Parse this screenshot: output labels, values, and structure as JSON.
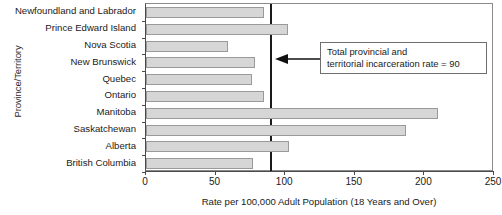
{
  "chart_data": {
    "type": "bar",
    "orientation": "horizontal",
    "title": "",
    "xlabel": "Rate per 100,000 Adult Population (18 Years and Over)",
    "ylabel": "Province/Territory",
    "xlim": [
      0,
      250
    ],
    "xticks": [
      0,
      50,
      100,
      150,
      200,
      250
    ],
    "xtick_labels": [
      "0",
      "50",
      "100",
      "150",
      "200",
      "250"
    ],
    "grid": false,
    "legend": null,
    "categories": [
      "Newfoundland and Labrador",
      "Prince Edward Island",
      "Nova Scotia",
      "New Brunswick",
      "Quebec",
      "Ontario",
      "Manitoba",
      "Saskatchewan",
      "Alberta",
      "British Columbia"
    ],
    "values": [
      85,
      102,
      59,
      78,
      76,
      85,
      210,
      187,
      103,
      77
    ],
    "bar_color": "#d6d6d6",
    "bar_edge_color": "#9a9a9a",
    "reference_line": {
      "value": 90,
      "color": "#1a1a1a",
      "annotation_lines": [
        "Total provincial and",
        "territorial incarceration rate = 90"
      ]
    }
  },
  "annotation": {
    "line1": "Total provincial and",
    "line2": "territorial incarceration rate = 90"
  },
  "axes": {
    "xlabel": "Rate per 100,000 Adult Population (18 Years and Over)",
    "ylabel": "Province/Territory"
  }
}
